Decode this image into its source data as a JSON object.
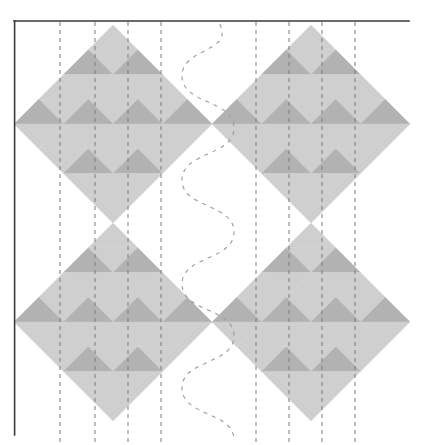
{
  "document": {
    "type": "quilt-block-layout-diagram",
    "title": "Quilt Block Layout Diagram",
    "canvas": {
      "width": 421,
      "height": 445,
      "background": "#ffffff"
    }
  },
  "colors": {
    "light_fabric": "#cfcfcf",
    "dark_fabric": "#b2b2b2",
    "background": "#ffffff",
    "frame_line": "#3a3a3a",
    "guide_line": "#7a7a7a",
    "quilting_line": "#9a9a9a"
  },
  "frame": {
    "label": "page-frame",
    "top_rule": {
      "x1": 14,
      "y1": 21,
      "x2": 409,
      "y2": 21,
      "width": 1.6
    },
    "left_rule": {
      "x1": 14.6,
      "y1": 21,
      "x2": 14.6,
      "y2": 435,
      "width": 1.6
    }
  },
  "blocks": {
    "label": "on-point square blocks",
    "count": 4,
    "grid_divisions": 4,
    "half_diagonal": 99,
    "items": [
      {
        "name": "block-top-left",
        "cx": 113,
        "cy": 124
      },
      {
        "name": "block-top-right",
        "cx": 311,
        "cy": 124
      },
      {
        "name": "block-bottom-left",
        "cx": 113,
        "cy": 322
      },
      {
        "name": "block-bottom-right",
        "cx": 311,
        "cy": 322
      }
    ],
    "unit_pattern": {
      "description": "each block is a 4x4 grid of squares rotated 45 degrees; every square is split into a light triangle and a dark triangle",
      "dark_cells": [
        [
          0,
          1
        ],
        [
          0,
          3
        ],
        [
          1,
          0
        ],
        [
          1,
          2
        ],
        [
          2,
          1
        ],
        [
          2,
          3
        ],
        [
          3,
          0
        ],
        [
          3,
          2
        ]
      ]
    }
  },
  "guide_lines": {
    "label": "vertical dashed quilting guides",
    "dash": "4,4",
    "width": 1,
    "y_top": 22,
    "y_bottom": 443,
    "x_positions": [
      60,
      95,
      128,
      161,
      256,
      289,
      322,
      355
    ]
  },
  "quilting_line": {
    "label": "serpentine center quilting line",
    "dash": "4,5",
    "width": 1.1,
    "amplitude": 26,
    "center_x": 208,
    "y_start": 24,
    "y_end": 440,
    "wavelength": 104
  },
  "legend": {
    "light_label": "Light fabric",
    "dark_label": "Dark fabric",
    "guide_label": "Stitching guide",
    "quilt_label": "Quilting line"
  }
}
